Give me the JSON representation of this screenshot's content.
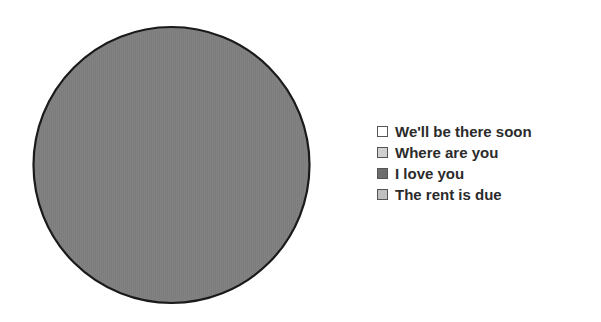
{
  "chart_data": {
    "type": "pie",
    "title": "",
    "subtitle": "",
    "xlabel": "",
    "ylabel": "",
    "grid": false,
    "legend_position": "right",
    "categories": [
      "We'll be there soon",
      "Where are you",
      "I love you",
      "The rent is due"
    ],
    "values": [
      100,
      0,
      0,
      0
    ],
    "slices": [
      {
        "label": "We'll be there soon",
        "value": 100,
        "color": "#7d7d7d",
        "swatch_color": "#ffffff"
      },
      {
        "label": "Where are you",
        "value": 0,
        "color": "#d0d0d0",
        "swatch_color": "#d0d0d0"
      },
      {
        "label": "I love you",
        "value": 0,
        "color": "#6e6e6e",
        "swatch_color": "#6e6e6e"
      },
      {
        "label": "The rent is due",
        "value": 0,
        "color": "#c0c0c0",
        "swatch_color": "#c0c0c0"
      }
    ],
    "annotations": []
  },
  "pie": {
    "fill_color": "#7d7d7d",
    "outline_color": "#1a1a1a",
    "center_x": 171.5,
    "center_y": 165,
    "radius": 138
  },
  "legend": {
    "items": [
      {
        "label": "We'll be there soon",
        "swatch": "#ffffff"
      },
      {
        "label": "Where are you",
        "swatch": "#d0d0d0"
      },
      {
        "label": "I love you",
        "swatch": "#6e6e6e"
      },
      {
        "label": "The rent is due",
        "swatch": "#c0c0c0"
      }
    ]
  },
  "colors": {
    "background": "#ffffff",
    "text": "#2b2b2b",
    "swatch_border": "#555555",
    "pie_outline": "#1a1a1a"
  }
}
